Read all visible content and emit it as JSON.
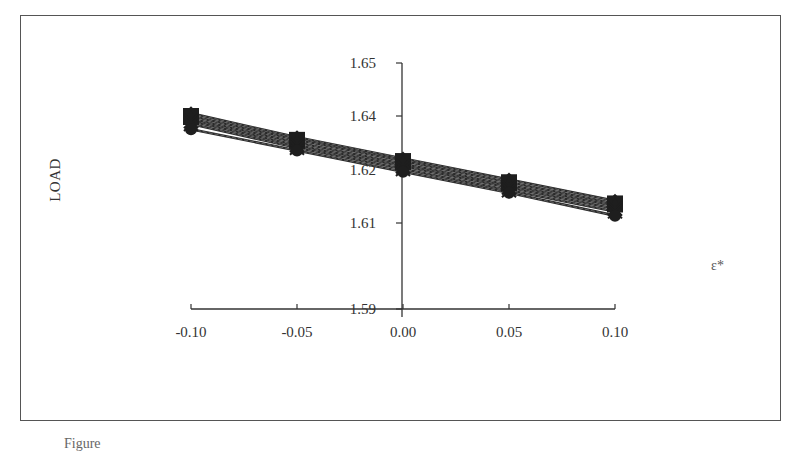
{
  "chart_data": {
    "type": "line",
    "title": "",
    "xlabel": "ε*",
    "ylabel": "LOAD",
    "x": [
      -0.1,
      -0.05,
      0.0,
      0.05,
      0.1
    ],
    "x_tick_labels": [
      "-0.10",
      "-0.05",
      "0.00",
      "0.05",
      "0.10"
    ],
    "y_tick_labels": [
      "1.65",
      "1.64",
      "1.62",
      "1.61",
      "1.59"
    ],
    "ylim": [
      1.59,
      1.65
    ],
    "grid": false,
    "legend": "none",
    "series": [
      {
        "name": "series-1",
        "marker": "diamond",
        "values": [
          1.6405,
          1.636,
          1.632,
          1.628,
          1.624
        ]
      },
      {
        "name": "series-2",
        "marker": "square",
        "values": [
          1.64,
          1.6355,
          1.6315,
          1.6275,
          1.6235
        ]
      },
      {
        "name": "series-3",
        "marker": "triangle",
        "values": [
          1.6395,
          1.635,
          1.631,
          1.627,
          1.623
        ]
      },
      {
        "name": "series-4",
        "marker": "x",
        "values": [
          1.639,
          1.6345,
          1.6305,
          1.6265,
          1.6225
        ]
      },
      {
        "name": "series-5",
        "marker": "star",
        "values": [
          1.6385,
          1.634,
          1.63,
          1.626,
          1.622
        ]
      },
      {
        "name": "series-6",
        "marker": "circle",
        "values": [
          1.6375,
          1.6335,
          1.6295,
          1.6255,
          1.6212
        ]
      }
    ]
  },
  "figure": {
    "caption": "Figure"
  }
}
